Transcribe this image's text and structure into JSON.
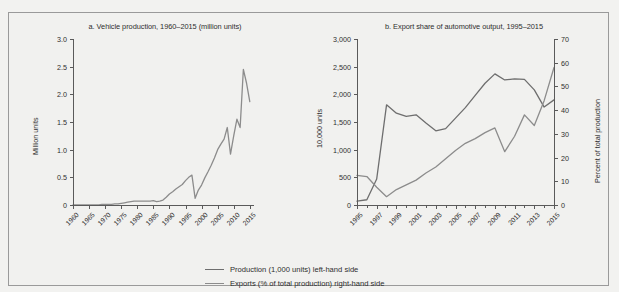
{
  "figure": {
    "background_color": "#f1f1ef",
    "line_color_production": "#8c8c8c",
    "line_color_exports": "#6e6e6e",
    "axis_color": "#5a5a5a",
    "cropped_top_title": ""
  },
  "legend": {
    "position": "bottom-center",
    "items": [
      {
        "label": "Production (1,000 units) left-hand side",
        "swatch": "dark"
      },
      {
        "label": "Exports (% of total production) right-hand side",
        "swatch": "light"
      }
    ]
  },
  "chart_data": [
    {
      "id": "panel-a",
      "type": "line",
      "title": "a. Vehicle production, 1960–2015 (million units)",
      "xlabel": "",
      "ylabel": "Million units",
      "ylim": [
        0,
        3.0
      ],
      "yticks": [
        0,
        0.5,
        1.0,
        1.5,
        2.0,
        2.5,
        3.0
      ],
      "ytick_labels": [
        "0",
        "0.5",
        "1.0",
        "1.5",
        "2.0",
        "2.5",
        "3.0"
      ],
      "xlim": [
        1960,
        2016
      ],
      "xticks": [
        1960,
        1965,
        1970,
        1975,
        1980,
        1985,
        1990,
        1995,
        2000,
        2005,
        2010,
        2015
      ],
      "xtick_labels": [
        "1960",
        "1965",
        "1970",
        "1975",
        "1980",
        "1985",
        "1990",
        "1995",
        "2000",
        "2005",
        "2010",
        "2015"
      ],
      "grid": false,
      "series": [
        {
          "name": "Vehicle production",
          "unit": "million units",
          "color": "#8c8c8c",
          "x": [
            1960,
            1961,
            1962,
            1963,
            1964,
            1965,
            1966,
            1967,
            1968,
            1969,
            1970,
            1971,
            1972,
            1973,
            1974,
            1975,
            1976,
            1977,
            1978,
            1979,
            1980,
            1981,
            1982,
            1983,
            1984,
            1985,
            1986,
            1987,
            1988,
            1989,
            1990,
            1991,
            1992,
            1993,
            1994,
            1995,
            1996,
            1997,
            1998,
            1999,
            2000,
            2001,
            2002,
            2003,
            2004,
            2005,
            2006,
            2007,
            2008,
            2009,
            2010,
            2011,
            2012,
            2013,
            2014,
            2015
          ],
          "values": [
            0.0,
            0.0,
            0.0,
            0.0,
            0.0,
            0.0,
            0.0,
            0.0,
            0.0,
            0.01,
            0.01,
            0.01,
            0.01,
            0.02,
            0.02,
            0.03,
            0.04,
            0.05,
            0.06,
            0.07,
            0.07,
            0.07,
            0.07,
            0.07,
            0.07,
            0.08,
            0.06,
            0.07,
            0.09,
            0.14,
            0.2,
            0.24,
            0.29,
            0.33,
            0.37,
            0.44,
            0.5,
            0.54,
            0.12,
            0.27,
            0.36,
            0.49,
            0.6,
            0.72,
            0.85,
            1.0,
            1.1,
            1.19,
            1.4,
            0.92,
            1.25,
            1.55,
            1.4,
            2.45,
            2.2,
            1.87
          ]
        }
      ]
    },
    {
      "id": "panel-b",
      "type": "line",
      "title": "b. Export share of automotive output, 1995–2015",
      "xlabel": "",
      "ylabel_left": "10,000 units",
      "ylabel_right": "Percent of total production",
      "ylim_left": [
        0,
        3000
      ],
      "yticks_left": [
        0,
        500,
        1000,
        1500,
        2000,
        2500,
        3000
      ],
      "ytick_labels_left": [
        "0",
        "500",
        "1,000",
        "1,500",
        "2,000",
        "2,500",
        "3,000"
      ],
      "ylim_right": [
        0,
        70
      ],
      "yticks_right": [
        0,
        10,
        20,
        30,
        40,
        50,
        60,
        70
      ],
      "ytick_labels_right": [
        "0",
        "10",
        "20",
        "30",
        "40",
        "50",
        "60",
        "70"
      ],
      "xlim": [
        1995,
        2015
      ],
      "xticks": [
        1995,
        1997,
        1999,
        2001,
        2003,
        2005,
        2007,
        2009,
        2011,
        2013,
        2015
      ],
      "xtick_labels": [
        "1995",
        "1997",
        "1999",
        "2001",
        "2003",
        "2005",
        "2007",
        "2009",
        "2011",
        "2013",
        "2015"
      ],
      "grid": false,
      "series": [
        {
          "name": "Production (1,000 units) left-hand side",
          "axis": "left",
          "unit": "10,000 units",
          "color": "#6e6e6e",
          "x": [
            1995,
            1996,
            1997,
            1998,
            1999,
            2000,
            2001,
            2002,
            2003,
            2004,
            2005,
            2006,
            2007,
            2008,
            2009,
            2010,
            2011,
            2012,
            2013,
            2014,
            2015
          ],
          "values": [
            70,
            95,
            470,
            1810,
            1660,
            1600,
            1630,
            1480,
            1340,
            1380,
            1570,
            1760,
            1980,
            2200,
            2370,
            2260,
            2280,
            2270,
            2080,
            1770,
            1900,
            2350,
            2600,
            2680
          ]
        },
        {
          "name": "Exports (% of total production) right-hand side",
          "axis": "right",
          "unit": "percent",
          "color": "#8c8c8c",
          "x": [
            1995,
            1996,
            1997,
            1998,
            1999,
            2000,
            2001,
            2002,
            2003,
            2004,
            2005,
            2006,
            2007,
            2008,
            2009,
            2010,
            2011,
            2012,
            2013,
            2014,
            2015
          ],
          "values": [
            12.5,
            12.0,
            7.5,
            3.5,
            6.5,
            8.5,
            10.5,
            13.5,
            16.0,
            19.5,
            23.0,
            26.0,
            28.0,
            30.5,
            32.5,
            22.5,
            29.0,
            38.0,
            33.5,
            44.0,
            58.0,
            57.5,
            45.5,
            44.0
          ]
        }
      ]
    }
  ]
}
